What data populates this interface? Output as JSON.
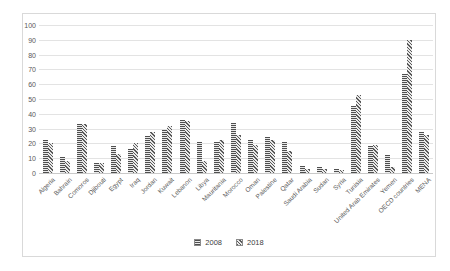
{
  "chart_data": {
    "type": "bar",
    "title": "",
    "xlabel": "",
    "ylabel": "",
    "categories": [
      "Algeria",
      "Bahrain",
      "Comoros",
      "Djibouti",
      "Egypt",
      "Iraq",
      "Jordan",
      "Kuwait",
      "Lebanon",
      "Libya",
      "Mauritania",
      "Morocco",
      "Oman",
      "Palestine",
      "Qatar",
      "Saudi Arabia",
      "Sudan",
      "Syria",
      "Tunisia",
      "United Arab Emirates",
      "Yemen",
      "OECD countries",
      "MENA"
    ],
    "series": [
      {
        "name": "2008",
        "values": [
          22,
          11,
          33,
          7,
          18,
          16,
          25,
          29,
          36,
          21,
          21,
          34,
          22,
          24,
          21,
          5,
          4,
          3,
          45,
          18,
          12,
          67,
          28
        ]
      },
      {
        "name": "2018",
        "values": [
          20,
          8,
          33,
          7,
          13,
          20,
          28,
          32,
          35,
          8,
          22,
          26,
          19,
          22,
          15,
          3,
          3,
          2,
          53,
          19,
          4,
          90,
          26
        ]
      }
    ],
    "ylim": [
      0,
      100
    ],
    "ytick_step": 10,
    "grid": true,
    "legend_position": "bottom"
  },
  "colors": {
    "background": "#ffffff",
    "frame_border": "#d9d9d9",
    "gridline": "#e3e3e3",
    "axis_text": "#595959",
    "bar_hatch": "#4f4f4f"
  }
}
